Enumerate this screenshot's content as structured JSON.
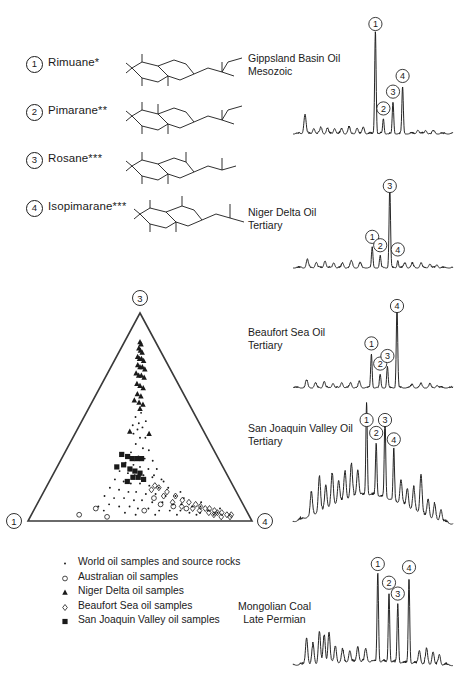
{
  "figure": {
    "type": "scientific-figure",
    "ink_color": "#1a1a1a",
    "background": "#ffffff"
  },
  "compound_key": {
    "items": [
      {
        "number": "1",
        "name": "Rimuane",
        "stars": "*",
        "structure": "rimuane-skeleton"
      },
      {
        "number": "2",
        "name": "Pimarane",
        "stars": "**",
        "structure": "pimarane-skeleton"
      },
      {
        "number": "3",
        "name": "Rosane",
        "stars": "***",
        "structure": "rosane-skeleton"
      },
      {
        "number": "4",
        "name": "Isopimarane",
        "stars": "***",
        "structure": "isopimarane-skeleton"
      }
    ]
  },
  "ternary": {
    "vertices": {
      "bottom_left": "1",
      "top": "3",
      "bottom_right": "4"
    },
    "series": [
      {
        "name": "World oil samples and source rocks",
        "marker": "dot",
        "points": [
          [
            0.46,
            0.5
          ],
          [
            0.49,
            0.47
          ],
          [
            0.52,
            0.45
          ],
          [
            0.45,
            0.42
          ],
          [
            0.5,
            0.4
          ],
          [
            0.54,
            0.4
          ],
          [
            0.47,
            0.37
          ],
          [
            0.52,
            0.35
          ],
          [
            0.56,
            0.34
          ],
          [
            0.44,
            0.33
          ],
          [
            0.49,
            0.31
          ],
          [
            0.53,
            0.3
          ],
          [
            0.58,
            0.29
          ],
          [
            0.41,
            0.28
          ],
          [
            0.46,
            0.27
          ],
          [
            0.5,
            0.26
          ],
          [
            0.55,
            0.25
          ],
          [
            0.6,
            0.25
          ],
          [
            0.38,
            0.24
          ],
          [
            0.43,
            0.23
          ],
          [
            0.47,
            0.22
          ],
          [
            0.52,
            0.22
          ],
          [
            0.57,
            0.21
          ],
          [
            0.62,
            0.2
          ],
          [
            0.36,
            0.2
          ],
          [
            0.41,
            0.19
          ],
          [
            0.45,
            0.18
          ],
          [
            0.5,
            0.18
          ],
          [
            0.55,
            0.17
          ],
          [
            0.6,
            0.16
          ],
          [
            0.65,
            0.16
          ],
          [
            0.34,
            0.16
          ],
          [
            0.39,
            0.15
          ],
          [
            0.44,
            0.14
          ],
          [
            0.48,
            0.14
          ],
          [
            0.53,
            0.13
          ],
          [
            0.58,
            0.13
          ],
          [
            0.63,
            0.12
          ],
          [
            0.68,
            0.12
          ],
          [
            0.72,
            0.11
          ],
          [
            0.32,
            0.12
          ],
          [
            0.37,
            0.11
          ],
          [
            0.42,
            0.11
          ],
          [
            0.47,
            0.1
          ],
          [
            0.51,
            0.1
          ],
          [
            0.56,
            0.09
          ],
          [
            0.61,
            0.09
          ],
          [
            0.66,
            0.08
          ],
          [
            0.7,
            0.08
          ],
          [
            0.75,
            0.07
          ],
          [
            0.79,
            0.07
          ],
          [
            0.35,
            0.08
          ],
          [
            0.4,
            0.07
          ],
          [
            0.45,
            0.07
          ],
          [
            0.49,
            0.06
          ],
          [
            0.54,
            0.06
          ],
          [
            0.59,
            0.05
          ],
          [
            0.64,
            0.05
          ],
          [
            0.69,
            0.05
          ],
          [
            0.73,
            0.04
          ],
          [
            0.78,
            0.04
          ],
          [
            0.82,
            0.05
          ],
          [
            0.86,
            0.04
          ],
          [
            0.3,
            0.07
          ],
          [
            0.33,
            0.05
          ],
          [
            0.43,
            0.04
          ],
          [
            0.48,
            0.03
          ],
          [
            0.57,
            0.03
          ],
          [
            0.67,
            0.03
          ],
          [
            0.76,
            0.03
          ],
          [
            0.84,
            0.03
          ],
          [
            0.88,
            0.06
          ],
          [
            0.8,
            0.09
          ],
          [
            0.71,
            0.14
          ],
          [
            0.63,
            0.19
          ],
          [
            0.58,
            0.22
          ],
          [
            0.48,
            0.44
          ],
          [
            0.51,
            0.52
          ],
          [
            0.44,
            0.46
          ],
          [
            0.55,
            0.48
          ]
        ]
      },
      {
        "name": "Australian oil samples",
        "marker": "open-circle",
        "points": [
          [
            0.29,
            0.06
          ],
          [
            0.22,
            0.03
          ],
          [
            0.35,
            0.02
          ],
          [
            0.6,
            0.08
          ],
          [
            0.66,
            0.07
          ],
          [
            0.72,
            0.06
          ],
          [
            0.57,
            0.11
          ],
          [
            0.52,
            0.05
          ]
        ]
      },
      {
        "name": "Niger Delta oil samples",
        "marker": "filled-triangle",
        "points": [
          [
            0.5,
            0.86
          ],
          [
            0.53,
            0.85
          ],
          [
            0.47,
            0.83
          ],
          [
            0.51,
            0.82
          ],
          [
            0.55,
            0.81
          ],
          [
            0.45,
            0.79
          ],
          [
            0.49,
            0.78
          ],
          [
            0.53,
            0.78
          ],
          [
            0.57,
            0.77
          ],
          [
            0.46,
            0.75
          ],
          [
            0.5,
            0.74
          ],
          [
            0.54,
            0.74
          ],
          [
            0.58,
            0.73
          ],
          [
            0.44,
            0.71
          ],
          [
            0.48,
            0.7
          ],
          [
            0.52,
            0.7
          ],
          [
            0.56,
            0.69
          ],
          [
            0.46,
            0.66
          ],
          [
            0.5,
            0.65
          ],
          [
            0.54,
            0.64
          ],
          [
            0.47,
            0.61
          ],
          [
            0.51,
            0.6
          ],
          [
            0.44,
            0.58
          ],
          [
            0.49,
            0.57
          ],
          [
            0.53,
            0.56
          ],
          [
            0.42,
            0.43
          ],
          [
            0.57,
            0.42
          ],
          [
            0.5,
            0.54
          ]
        ]
      },
      {
        "name": "Beaufort Sea oil samples",
        "marker": "open-diamond",
        "points": [
          [
            0.6,
            0.16
          ],
          [
            0.64,
            0.14
          ],
          [
            0.68,
            0.12
          ],
          [
            0.71,
            0.1
          ],
          [
            0.74,
            0.09
          ],
          [
            0.77,
            0.08
          ],
          [
            0.79,
            0.07
          ],
          [
            0.81,
            0.06
          ],
          [
            0.83,
            0.06
          ],
          [
            0.85,
            0.05
          ],
          [
            0.86,
            0.04
          ],
          [
            0.88,
            0.04
          ],
          [
            0.9,
            0.03
          ],
          [
            0.92,
            0.03
          ],
          [
            0.78,
            0.05
          ],
          [
            0.82,
            0.04
          ],
          [
            0.84,
            0.03
          ],
          [
            0.75,
            0.06
          ],
          [
            0.7,
            0.07
          ],
          [
            0.66,
            0.09
          ],
          [
            0.62,
            0.12
          ],
          [
            0.58,
            0.17
          ],
          [
            0.56,
            0.15
          ],
          [
            0.87,
            0.02
          ],
          [
            0.91,
            0.02
          ]
        ]
      },
      {
        "name": "San Joaquin Valley oil samples",
        "marker": "filled-square",
        "points": [
          [
            0.38,
            0.32
          ],
          [
            0.42,
            0.31
          ],
          [
            0.45,
            0.3
          ],
          [
            0.48,
            0.3
          ],
          [
            0.51,
            0.3
          ],
          [
            0.36,
            0.26
          ],
          [
            0.4,
            0.27
          ],
          [
            0.44,
            0.25
          ],
          [
            0.47,
            0.24
          ],
          [
            0.5,
            0.23
          ],
          [
            0.46,
            0.21
          ],
          [
            0.49,
            0.21
          ],
          [
            0.52,
            0.2
          ],
          [
            0.43,
            0.19
          ]
        ]
      }
    ]
  },
  "legend": {
    "items": [
      {
        "marker": "dot",
        "label": "World oil samples and source rocks"
      },
      {
        "marker": "open-circle",
        "label": "Australian oil samples"
      },
      {
        "marker": "filled-triangle",
        "label": "Niger Delta oil samples"
      },
      {
        "marker": "open-diamond",
        "label": "Beaufort Sea oil samples"
      },
      {
        "marker": "filled-square",
        "label": "San Joaquin Valley oil samples"
      }
    ]
  },
  "chromatograms": [
    {
      "id": "gippsland",
      "title_line1": "Gippsland Basin Oil",
      "title_line2": "Mesozoic",
      "labeled_peaks": [
        {
          "number": "1",
          "x": 0.515,
          "height": 0.92
        },
        {
          "number": "2",
          "x": 0.565,
          "height": 0.13
        },
        {
          "number": "3",
          "x": 0.625,
          "height": 0.28
        },
        {
          "number": "4",
          "x": 0.685,
          "height": 0.42
        }
      ]
    },
    {
      "id": "niger-delta",
      "title_line1": "Niger Delta Oil",
      "title_line2": "Tertiary",
      "labeled_peaks": [
        {
          "number": "1",
          "x": 0.495,
          "height": 0.24
        },
        {
          "number": "2",
          "x": 0.545,
          "height": 0.14
        },
        {
          "number": "3",
          "x": 0.605,
          "height": 0.97
        },
        {
          "number": "4",
          "x": 0.655,
          "height": 0.09
        }
      ]
    },
    {
      "id": "beaufort-sea",
      "title_line1": "Beaufort Sea Oil",
      "title_line2": "Tertiary",
      "labeled_peaks": [
        {
          "number": "1",
          "x": 0.49,
          "height": 0.4
        },
        {
          "number": "2",
          "x": 0.545,
          "height": 0.16
        },
        {
          "number": "3",
          "x": 0.59,
          "height": 0.25
        },
        {
          "number": "4",
          "x": 0.65,
          "height": 0.95
        }
      ]
    },
    {
      "id": "san-joaquin",
      "title_line1": "San Joaquin Valley Oil",
      "title_line2": "Tertiary",
      "labeled_peaks": [
        {
          "number": "1",
          "x": 0.46,
          "height": 0.84
        },
        {
          "number": "2",
          "x": 0.52,
          "height": 0.47
        },
        {
          "number": "3",
          "x": 0.575,
          "height": 0.71
        },
        {
          "number": "4",
          "x": 0.63,
          "height": 0.46
        }
      ]
    },
    {
      "id": "mongolian-coal",
      "title_line1": "Mongolian Coal",
      "title_line2": "Late Permian",
      "labeled_peaks": [
        {
          "number": "1",
          "x": 0.53,
          "height": 0.86
        },
        {
          "number": "2",
          "x": 0.6,
          "height": 0.66
        },
        {
          "number": "3",
          "x": 0.655,
          "height": 0.56
        },
        {
          "number": "4",
          "x": 0.725,
          "height": 0.82
        }
      ]
    }
  ]
}
